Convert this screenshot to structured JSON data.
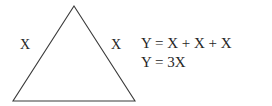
{
  "figure": {
    "stroke_color": "#3a3a3a",
    "text_color": "#262626",
    "background_color": "#ffffff"
  },
  "triangle": {
    "label_left": "X",
    "label_right": "X",
    "apex": {
      "x": 74,
      "y": 6
    },
    "bottom_left": {
      "x": 13,
      "y": 101
    },
    "bottom_right": {
      "x": 135,
      "y": 101
    }
  },
  "equations": {
    "line1": "Y = X + X + X",
    "line2": "Y = 3X"
  }
}
